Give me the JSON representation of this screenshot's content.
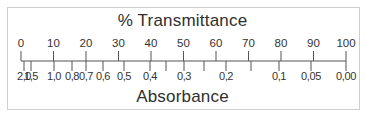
{
  "diagram": {
    "top_title": "% Transmittance",
    "bottom_title": "Absorbance",
    "axis": {
      "x_start": 21,
      "x_end": 346,
      "y": 61
    },
    "transmittance_ticks": [
      {
        "label": "0",
        "x": 21
      },
      {
        "label": "10",
        "x": 53.5
      },
      {
        "label": "20",
        "x": 86
      },
      {
        "label": "30",
        "x": 118.5
      },
      {
        "label": "40",
        "x": 151
      },
      {
        "label": "50",
        "x": 183.5
      },
      {
        "label": "60",
        "x": 216
      },
      {
        "label": "70",
        "x": 248.5
      },
      {
        "label": "80",
        "x": 281
      },
      {
        "label": "90",
        "x": 313.5
      },
      {
        "label": "100",
        "x": 346
      }
    ],
    "absorbance_ticks": [
      {
        "label": "2,0",
        "x": 24
      },
      {
        "label": "1,5",
        "x": 31
      },
      {
        "label": "1,0",
        "x": 54
      },
      {
        "label": "0,8",
        "x": 72
      },
      {
        "label": "0,7",
        "x": 86
      },
      {
        "label": "0,6",
        "x": 103
      },
      {
        "label": "0,5",
        "x": 124
      },
      {
        "label": "0,4",
        "x": 150
      },
      {
        "label": "",
        "x": 166
      },
      {
        "label": "0,3",
        "x": 184
      },
      {
        "label": "",
        "x": 204
      },
      {
        "label": "0,2",
        "x": 226
      },
      {
        "label": "",
        "x": 251
      },
      {
        "label": "0,1",
        "x": 279
      },
      {
        "label": "0,05",
        "x": 311
      },
      {
        "label": "0,00",
        "x": 346
      }
    ],
    "colors": {
      "line": "#555555",
      "frame": "#cfcfcf",
      "text": "#2f2f2f"
    }
  }
}
